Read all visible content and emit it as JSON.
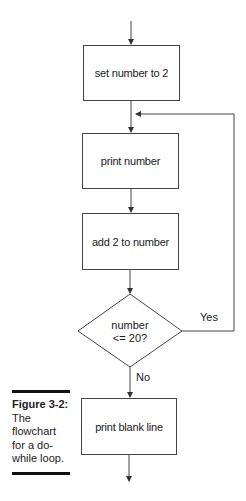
{
  "flowchart": {
    "steps": [
      {
        "id": "init",
        "type": "process",
        "label": "set number to 2"
      },
      {
        "id": "print",
        "type": "process",
        "label": "print number"
      },
      {
        "id": "add",
        "type": "process",
        "label": "add 2 to number"
      },
      {
        "id": "cond",
        "type": "decision",
        "label_line1": "number",
        "label_line2": "<= 20?"
      },
      {
        "id": "blank",
        "type": "process",
        "label": "print blank line"
      }
    ],
    "branches": {
      "yes_label": "Yes",
      "no_label": "No"
    }
  },
  "caption": {
    "title": "Figure 3-2:",
    "lines": [
      "The",
      "flowchart",
      "for a do-",
      "while loop."
    ]
  }
}
